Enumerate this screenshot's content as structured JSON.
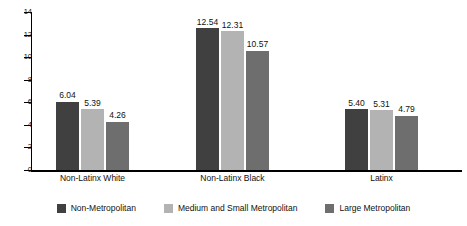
{
  "chart_data": {
    "type": "bar",
    "title": "",
    "subtitle": "",
    "xlabel": "",
    "ylabel": "",
    "ylim": [
      0,
      14
    ],
    "ytick_labels": [
      "0",
      "2",
      "4",
      "6",
      "8",
      "10",
      "12",
      "14"
    ],
    "ytick_values": [
      0,
      2,
      4,
      6,
      8,
      10,
      12,
      14
    ],
    "grid": false,
    "legend_position": "bottom",
    "categories": [
      "Non-Latinx White",
      "Non-Latinx Black",
      "Latinx"
    ],
    "series": [
      {
        "name": "Non-Metropolitan",
        "color": "#404040",
        "values": [
          6.04,
          5.39,
          5.4
        ],
        "labels": [
          "6.04",
          "5.39",
          "5.40"
        ]
      },
      {
        "name": "Medium and Small Metropolitan",
        "color": "#b3b3b3",
        "values": [
          5.39,
          12.31,
          5.31
        ],
        "labels": [
          "5.39",
          "12.31",
          "5.31"
        ]
      },
      {
        "name": "Large Metropolitan",
        "color": "#6e6e6e",
        "values": [
          4.26,
          10.57,
          4.79
        ],
        "labels": [
          "4.26",
          "10.57",
          "4.79"
        ]
      }
    ],
    "groups": [
      {
        "category": "Non-Latinx White",
        "bars": [
          {
            "series": "Non-Metropolitan",
            "value": 6.04,
            "label": "6.04",
            "color": "#404040"
          },
          {
            "series": "Medium and Small Metropolitan",
            "value": 5.39,
            "label": "5.39",
            "color": "#b3b3b3"
          },
          {
            "series": "Large Metropolitan",
            "value": 4.26,
            "label": "4.26",
            "color": "#6e6e6e"
          }
        ]
      },
      {
        "category": "Non-Latinx Black",
        "bars": [
          {
            "series": "Non-Metropolitan",
            "value": 12.54,
            "label": "12.54",
            "color": "#404040"
          },
          {
            "series": "Medium and Small Metropolitan",
            "value": 12.31,
            "label": "12.31",
            "color": "#b3b3b3"
          },
          {
            "series": "Large Metropolitan",
            "value": 10.57,
            "label": "10.57",
            "color": "#6e6e6e"
          }
        ]
      },
      {
        "category": "Latinx",
        "bars": [
          {
            "series": "Non-Metropolitan",
            "value": 5.4,
            "label": "5.40",
            "color": "#404040"
          },
          {
            "series": "Medium and Small Metropolitan",
            "value": 5.31,
            "label": "5.31",
            "color": "#b3b3b3"
          },
          {
            "series": "Large Metropolitan",
            "value": 4.79,
            "label": "4.79",
            "color": "#6e6e6e"
          }
        ]
      }
    ]
  },
  "axis": {
    "ticks": [
      {
        "label": "14",
        "value": 14
      },
      {
        "label": "12",
        "value": 12
      },
      {
        "label": "10",
        "value": 10
      },
      {
        "label": "8",
        "value": 8
      },
      {
        "label": "6",
        "value": 6
      },
      {
        "label": "4",
        "value": 4
      },
      {
        "label": "2",
        "value": 2
      },
      {
        "label": "0",
        "value": 0
      }
    ]
  },
  "legend": {
    "items": [
      {
        "label": "Non-Metropolitan",
        "color": "#404040"
      },
      {
        "label": "Medium and Small Metropolitan",
        "color": "#b3b3b3"
      },
      {
        "label": "Large Metropolitan",
        "color": "#6e6e6e"
      }
    ]
  }
}
